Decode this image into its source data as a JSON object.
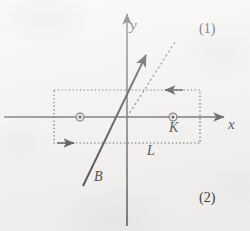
{
  "figure": {
    "background_color": "#f4f3f1",
    "ink_color": "#4a4745",
    "dark_ink_color": "#2e2c2b",
    "axes": {
      "x_axis_label": "x",
      "y_axis_label": "y",
      "origin": {
        "x": 127,
        "y": 117
      },
      "x_axis": {
        "x1": 4,
        "y1": 117,
        "x2": 228,
        "y2": 117,
        "arrow": "right"
      },
      "y_axis": {
        "x1": 127,
        "y1": 10,
        "x2": 127,
        "y2": 226,
        "arrow": "up"
      }
    },
    "region": {
      "label": "L",
      "style": "dotted-rectangle",
      "left": 54,
      "top": 90,
      "right": 200,
      "bottom": 143,
      "edge_arrows": [
        {
          "name": "top-edge-arrow",
          "direction": "left",
          "x": 170,
          "y": 90
        },
        {
          "name": "bottom-edge-arrow",
          "direction": "right",
          "x": 68,
          "y": 143
        }
      ]
    },
    "field_markers": [
      {
        "name": "field-out-of-page-left",
        "symbol": "dot-in-circle",
        "x": 80,
        "y": 117
      },
      {
        "name": "field-out-of-page-right",
        "symbol": "dot-in-circle",
        "x": 173,
        "y": 117,
        "label": "K"
      }
    ],
    "vector": {
      "label": "B",
      "style": "solid-with-arrowhead",
      "tail": {
        "x": 83,
        "y": 186
      },
      "tip": {
        "x": 149,
        "y": 50
      }
    },
    "reference_line": {
      "name": "dashed-reference-line",
      "style": "dashed",
      "from": {
        "x": 127,
        "y": 117
      },
      "to": {
        "x": 175,
        "y": 42
      }
    },
    "annotations": [
      {
        "name": "region-label-1",
        "text": "(1)"
      },
      {
        "name": "region-label-2",
        "text": "(2)"
      }
    ]
  }
}
